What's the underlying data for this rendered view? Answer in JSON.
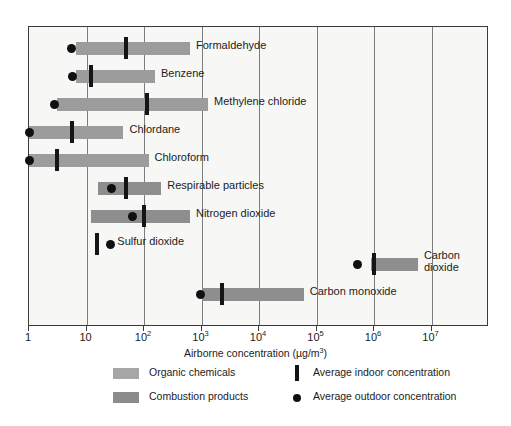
{
  "chart_data": {
    "type": "bar",
    "orientation": "horizontal-range",
    "title": "",
    "xlabel": "Airborne concentration (µg/m³)",
    "ylabel": "",
    "xscale": "log",
    "xlim": [
      1,
      100000000
    ],
    "grid": true,
    "xticks": [
      {
        "value": 1,
        "mantissa": "1",
        "exponent": ""
      },
      {
        "value": 10,
        "mantissa": "10",
        "exponent": ""
      },
      {
        "value": 100,
        "mantissa": "10",
        "exponent": "2"
      },
      {
        "value": 1000,
        "mantissa": "10",
        "exponent": "3"
      },
      {
        "value": 10000,
        "mantissa": "10",
        "exponent": "4"
      },
      {
        "value": 100000,
        "mantissa": "10",
        "exponent": "5"
      },
      {
        "value": 1000000,
        "mantissa": "10",
        "exponent": "6"
      },
      {
        "value": 10000000,
        "mantissa": "10",
        "exponent": "7"
      }
    ],
    "series": [
      {
        "name": "Formaldehyde",
        "category": "Organic chemicals",
        "range_low": 6.5,
        "range_high": 630,
        "indoor_average": 48,
        "outdoor_average": 5.5
      },
      {
        "name": "Benzene",
        "category": "Organic chemicals",
        "range_low": 6.5,
        "range_high": 155,
        "indoor_average": 12,
        "outdoor_average": 5.8
      },
      {
        "name": "Methylene chloride",
        "category": "Organic chemicals",
        "range_low": 3.1,
        "range_high": 1300,
        "indoor_average": 115,
        "outdoor_average": 2.8
      },
      {
        "name": "Chlordane",
        "category": "Organic chemicals",
        "range_low": 1.0,
        "range_high": 44,
        "indoor_average": 5.6,
        "outdoor_average": 1.0
      },
      {
        "name": "Chloroform",
        "category": "Organic chemicals",
        "range_low": 1.0,
        "range_high": 120,
        "indoor_average": 3.1,
        "outdoor_average": 1.0
      },
      {
        "name": "Respirable particles",
        "category": "Combustion products",
        "range_low": 16,
        "range_high": 200,
        "indoor_average": 48,
        "outdoor_average": 27
      },
      {
        "name": "Nitrogen dioxide",
        "category": "Combustion products",
        "range_low": 12,
        "range_high": 630,
        "indoor_average": 100,
        "outdoor_average": 63
      },
      {
        "name": "Sulfur dioxide",
        "category": "Combustion products",
        "range_low": null,
        "range_high": null,
        "indoor_average": 15,
        "outdoor_average": 26
      },
      {
        "name": "Carbon dioxide",
        "category": "Combustion products",
        "range_low": 900000,
        "range_high": 5800000,
        "indoor_average": 1000000,
        "outdoor_average": 520000
      },
      {
        "name": "Carbon monoxide",
        "category": "Combustion products",
        "range_low": 1000,
        "range_high": 60000,
        "indoor_average": 2300,
        "outdoor_average": 980
      }
    ],
    "legend": {
      "position": "bottom",
      "entries": [
        {
          "label": "Organic chemicals",
          "marker": "swatch-light",
          "color": "#a6a6a6"
        },
        {
          "label": "Combustion products",
          "marker": "swatch-dark",
          "color": "#8b8b8b"
        },
        {
          "label": "Average indoor concentration",
          "marker": "vertical-bar",
          "color": "#141414"
        },
        {
          "label": "Average outdoor concentration",
          "marker": "filled-circle",
          "color": "#101010"
        }
      ]
    }
  },
  "labels": {
    "formaldehyde": "Formaldehyde",
    "benzene": "Benzene",
    "methylene_chloride": "Methylene chloride",
    "chlordane": "Chlordane",
    "chloroform": "Chloroform",
    "respirable_particles": "Respirable particles",
    "nitrogen_dioxide": "Nitrogen dioxide",
    "sulfur_dioxide": "Sulfur dioxide",
    "carbon_dioxide": "Carbon dioxide",
    "carbon_monoxide": "Carbon monoxide"
  },
  "axis": {
    "title": "Airborne concentration (µg/m³)"
  },
  "legend_labels": {
    "organic": "Organic chemicals",
    "combustion": "Combustion products",
    "indoor": "Average indoor concentration",
    "outdoor": "Average outdoor concentration"
  }
}
